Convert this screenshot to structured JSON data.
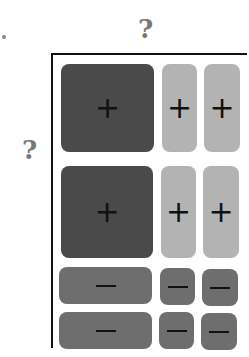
{
  "labels": {
    "top_question": "?",
    "left_question": "?"
  },
  "grid": {
    "columns": 3,
    "rows": [
      {
        "cells": [
          {
            "sign": "+",
            "shade": "dark"
          },
          {
            "sign": "+",
            "shade": "light"
          },
          {
            "sign": "+",
            "shade": "light"
          }
        ]
      },
      {
        "cells": [
          {
            "sign": "+",
            "shade": "dark"
          },
          {
            "sign": "+",
            "shade": "light"
          },
          {
            "sign": "+",
            "shade": "light"
          }
        ]
      },
      {
        "cells": [
          {
            "sign": "−",
            "shade": "mid"
          },
          {
            "sign": "−",
            "shade": "mid"
          },
          {
            "sign": "−",
            "shade": "mid"
          }
        ]
      },
      {
        "cells": [
          {
            "sign": "−",
            "shade": "mid"
          },
          {
            "sign": "−",
            "shade": "mid"
          },
          {
            "sign": "−",
            "shade": "mid"
          }
        ]
      }
    ]
  },
  "colors": {
    "dark": "#4a4a4a",
    "light": "#b3b3b3",
    "mid": "#6e6e6e",
    "axis": "#111111",
    "question": "#777777"
  }
}
